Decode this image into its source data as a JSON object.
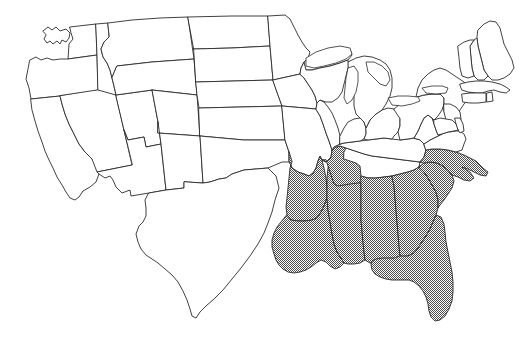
{
  "map": {
    "title": "United States map with highlighted southeastern states",
    "region_label": "Contiguous United States",
    "background_color": "#ffffff",
    "outline_color": "#2b2b2b",
    "highlight_fill_color": "#808080",
    "highlight_pattern": "checkerboard-dither",
    "unhighlighted_fill_color": "#ffffff",
    "highlighted_count": "9",
    "legend_visible": "false",
    "labels_visible": "false",
    "highlighted_states": [
      "Arkansas",
      "Louisiana",
      "Mississippi",
      "Alabama",
      "Georgia",
      "Florida",
      "South Carolina",
      "North Carolina",
      "Tennessee (western)"
    ],
    "states": [
      {
        "id": "WA",
        "name": "Washington",
        "highlighted": false,
        "path": "M43,31 L48,27 L52,30 L56,27 L60,31 L66,29 L70,33 L69,38 L66,42 L62,40 L60,44 L57,41 L53,44 L50,41 L47,43 L44,39 L46,35 Z M70,27 L96,24 L97,55 L68,59 L69,44 L73,39 L71,33 Z"
      },
      {
        "id": "OR",
        "name": "Oregon",
        "highlighted": false,
        "path": "M30,60 L36,57 L41,60 L47,58 L53,60 L60,59 L68,59 L97,55 L98,90 L93,92 L60,96 L31,99 L29,88 L26,79 L28,69 Z"
      },
      {
        "id": "CA",
        "name": "California",
        "highlighted": false,
        "path": "M31,99 L60,96 L62,104 L65,114 L69,124 L74,134 L79,144 L85,152 L92,159 L97,166 L99,174 L96,182 L90,187 L83,191 L79,197 L75,200 L70,198 L66,192 L62,185 L57,177 L53,168 L49,160 L45,151 L42,142 L38,131 L35,121 L32,110 Z"
      },
      {
        "id": "ID",
        "name": "Idaho",
        "highlighted": false,
        "path": "M96,24 L108,23 L109,37 L104,42 L101,49 L103,57 L107,63 L110,70 L112,78 L114,86 L116,95 L98,98 L97,55 Z"
      },
      {
        "id": "NV",
        "name": "Nevada",
        "highlighted": false,
        "path": "M98,90 L116,95 L124,130 L132,165 L97,172 L92,159 L85,152 L79,144 L74,134 L69,124 L65,114 L62,104 L60,96 Z"
      },
      {
        "id": "UT",
        "name": "Utah",
        "highlighted": false,
        "path": "M116,95 L152,90 L158,122 L161,144 L146,147 L144,137 L128,140 L124,130 Z"
      },
      {
        "id": "AZ",
        "name": "Arizona",
        "highlighted": false,
        "path": "M124,130 L128,140 L144,137 L146,147 L161,144 L166,190 L149,193 L131,196 L130,190 L122,193 L116,187 L113,180 L110,176 L105,178 L99,174 L97,172 L132,165 Z"
      },
      {
        "id": "MT",
        "name": "Montana",
        "highlighted": false,
        "path": "M108,23 L132,20 L160,18 L188,17 L194,59 L152,62 L117,66 L112,78 L110,70 L107,63 L103,57 L101,49 L104,42 L109,37 Z"
      },
      {
        "id": "WY",
        "name": "Wyoming",
        "highlighted": false,
        "path": "M117,66 L152,62 L194,59 L197,95 L152,90 L116,95 L114,86 L112,78 Z"
      },
      {
        "id": "CO",
        "name": "Colorado",
        "highlighted": false,
        "path": "M152,90 L197,95 L200,136 L158,133 L158,122 L152,90 Z"
      },
      {
        "id": "NM",
        "name": "New Mexico",
        "highlighted": false,
        "path": "M158,133 L200,136 L203,183 L184,182 L184,188 L166,190 L161,144 L158,122 Z"
      },
      {
        "id": "ND",
        "name": "North Dakota",
        "highlighted": false,
        "path": "M188,17 L232,16 L268,16 L270,46 L232,48 L194,49 Z"
      },
      {
        "id": "SD",
        "name": "South Dakota",
        "highlighted": false,
        "path": "M194,49 L232,48 L270,46 L273,80 L234,81 L196,82 Z"
      },
      {
        "id": "NE",
        "name": "Nebraska",
        "highlighted": false,
        "path": "M196,82 L234,81 L273,80 L278,95 L282,106 L241,107 L199,108 L197,95 Z"
      },
      {
        "id": "KS",
        "name": "Kansas",
        "highlighted": false,
        "path": "M199,108 L241,107 L282,106 L285,140 L244,140 L200,136 Z"
      },
      {
        "id": "OK",
        "name": "Oklahoma",
        "highlighted": false,
        "path": "M200,136 L244,140 L285,140 L289,152 L292,162 L282,162 L268,168 L256,169 L244,170 L232,174 L226,178 L219,179 L210,182 L203,183 L200,136 Z"
      },
      {
        "id": "TX",
        "name": "Texas",
        "highlighted": false,
        "path": "M203,183 L210,182 L219,179 L226,178 L232,174 L244,170 L256,169 L268,168 L276,176 L279,188 L275,200 L272,212 L268,223 L264,233 L258,244 L250,256 L241,268 L232,279 L223,290 L214,299 L206,306 L200,312 L196,318 L192,316 L190,309 L187,300 L183,291 L178,282 L172,275 L165,269 L158,263 L152,259 L146,255 L141,249 L138,242 L136,234 L139,226 L143,222 L146,216 L146,208 L145,200 L148,194 L149,193 L166,190 L184,188 L184,182 Z"
      },
      {
        "id": "MN",
        "name": "Minnesota",
        "highlighted": false,
        "path": "M268,16 L285,15 L290,19 L294,27 L298,35 L302,42 L306,48 L310,52 L308,58 L304,62 L301,68 L300,74 L273,80 L270,46 Z"
      },
      {
        "id": "IA",
        "name": "Iowa",
        "highlighted": false,
        "path": "M273,80 L300,74 L304,78 L308,84 L312,90 L315,96 L317,103 L316,109 L282,106 L278,95 Z"
      },
      {
        "id": "MO",
        "name": "Missouri",
        "highlighted": false,
        "path": "M282,106 L316,109 L320,116 L323,124 L326,133 L329,141 L332,150 L331,157 L326,162 L322,160 L320,156 L318,161 L316,168 L313,173 L309,176 L304,174 L298,172 L292,168 L289,161 L289,152 L285,140 Z"
      },
      {
        "id": "AR",
        "name": "Arkansas",
        "highlighted": true,
        "path": "M289,152 L289,161 L292,168 L298,172 L304,174 L309,176 L313,173 L316,168 L318,161 L320,156 L322,160 L324,168 L326,178 L327,188 L327,198 L324,206 L321,212 L317,218 L312,220 L305,221 L298,221 L291,220 L287,215 L286,207 L287,198 L288,188 L289,178 L290,168 L292,162 Z"
      },
      {
        "id": "LA",
        "name": "Louisiana",
        "highlighted": true,
        "path": "M287,215 L291,220 L298,221 L305,221 L312,220 L317,218 L321,212 L324,206 L327,198 L328,210 L330,222 L332,234 L334,244 L337,252 L341,258 L344,263 L340,267 L335,269 L330,266 L326,262 L321,260 L316,263 L311,267 L306,270 L300,272 L294,273 L288,272 L283,269 L279,265 L276,260 L274,254 L272,247 L272,240 L274,233 L277,227 L281,222 Z"
      },
      {
        "id": "MS",
        "name": "Mississippi",
        "highlighted": true,
        "path": "M327,198 L327,188 L327,178 L328,168 L330,160 L333,156 L338,157 L344,159 L350,161 L356,163 L360,166 L361,176 L361,187 L361,198 L361,209 L361,220 L362,231 L363,242 L364,252 L365,260 L360,263 L354,264 L348,264 L344,263 L341,258 L337,252 L334,244 L332,234 L330,222 L328,210 Z"
      },
      {
        "id": "TN",
        "name": "Tennessee",
        "highlighted": true,
        "path": "M322,160 L326,162 L331,157 L332,150 L336,147 L340,146 L346,148 L352,150 L358,152 L364,154 L372,156 L380,157 L388,158 L396,159 L404,160 L412,161 L418,162 L420,166 L416,170 L410,172 L404,174 L398,176 L390,178 L382,180 L374,181 L366,182 L358,183 L350,184 L344,185 L338,186 L334,184 L332,178 L330,172 L328,166 L326,160 Z",
        "note": "western-portion-shaded"
      },
      {
        "id": "TN-white",
        "name": "Tennessee eastern",
        "highlighted": false,
        "path": "M344,159 L350,161 L356,163 L360,166 L361,176 L368,178 L376,178 L384,177 L392,176 L400,174 L408,172 L414,170 L419,167 L420,162 L412,161 L404,160 L396,159 L388,158 L380,157 L372,156 L364,154 L358,152 L352,150 L346,148 L344,152 Z"
      },
      {
        "id": "KY",
        "name": "Kentucky",
        "highlighted": false,
        "path": "M332,150 L336,147 L340,146 L346,148 L352,150 L358,152 L364,154 L372,156 L380,157 L388,158 L396,159 L404,160 L412,161 L420,162 L424,157 L426,150 L424,144 L420,140 L414,138 L408,139 L400,140 L392,139 L384,138 L376,139 L368,140 L360,141 L352,142 L344,143 L338,145 L334,147 Z"
      },
      {
        "id": "AL",
        "name": "Alabama",
        "highlighted": true,
        "path": "M361,176 L368,178 L376,178 L384,177 L392,176 L394,186 L395,198 L396,210 L397,222 L398,234 L399,246 L400,256 L398,262 L392,264 L386,264 L378,264 L370,263 L365,260 L364,252 L363,242 L362,231 L361,220 L361,209 L361,198 L361,187 Z"
      },
      {
        "id": "GA",
        "name": "Georgia",
        "highlighted": true,
        "path": "M392,176 L400,174 L408,172 L414,170 L419,167 L424,172 L428,178 L432,185 L436,192 L438,200 L438,208 L436,215 L433,222 L430,229 L426,236 L422,242 L418,248 L414,253 L408,256 L402,257 L400,256 L399,246 L398,234 L397,222 L396,210 L395,198 L394,186 Z"
      },
      {
        "id": "FL",
        "name": "Florida",
        "highlighted": true,
        "path": "M400,256 L408,256 L414,253 L418,248 L422,242 L426,236 L430,229 L433,222 L436,215 L441,217 L444,224 L445,232 L446,242 L448,252 L450,262 L452,272 L453,282 L453,292 L452,301 L449,309 L445,316 L440,320 L435,321 L431,317 L429,311 L428,304 L426,297 L423,291 L419,286 L414,282 L409,280 L404,280 L398,280 L392,280 L386,279 L380,277 L375,274 L372,270 L371,265 L372,261 L376,259 L382,258 L388,258 L394,258 Z"
      },
      {
        "id": "SC",
        "name": "South Carolina",
        "highlighted": true,
        "path": "M419,167 L424,163 L430,162 L437,163 L443,166 L448,170 L452,175 L454,181 L452,188 L448,194 L444,200 L440,205 L438,208 L438,200 L436,192 L432,185 L428,178 L424,172 Z"
      },
      {
        "id": "NC",
        "name": "North Carolina",
        "highlighted": true,
        "path": "M420,162 L424,157 L426,150 L432,149 L440,149 L448,150 L456,152 L464,155 L470,158 L476,161 L480,165 L484,169 L488,172 L486,176 L480,175 L474,172 L468,169 L462,167 L470,172 L474,178 L470,181 L464,180 L458,177 L452,175 L448,170 L443,166 L437,163 L430,162 L424,163 Z"
      },
      {
        "id": "VA",
        "name": "Virginia",
        "highlighted": false,
        "path": "M424,144 L430,140 L436,137 L442,134 L448,132 L454,131 L460,131 L464,134 L466,139 L464,144 L462,150 L456,152 L448,150 L440,149 L432,149 L426,150 Z"
      },
      {
        "id": "WV",
        "name": "West Virginia",
        "highlighted": false,
        "path": "M414,138 L418,131 L421,124 L424,118 L428,115 L432,118 L434,124 L436,130 L438,135 L442,134 L436,137 L430,140 L424,144 L420,140 Z"
      },
      {
        "id": "IL",
        "name": "Illinois",
        "highlighted": false,
        "path": "M316,109 L317,103 L320,100 L324,102 L328,107 L332,113 L335,120 L338,128 L340,136 L340,144 L338,145 L334,147 L332,150 L329,141 L326,133 L323,124 L320,116 Z"
      },
      {
        "id": "IN",
        "name": "Indiana",
        "highlighted": false,
        "path": "M340,136 L344,128 L348,122 L354,119 L360,118 L364,122 L366,128 L366,134 L364,139 L360,141 L352,142 L344,143 L340,144 Z"
      },
      {
        "id": "OH",
        "name": "Ohio",
        "highlighted": false,
        "path": "M366,128 L370,120 L376,114 L382,110 L388,108 L394,109 L398,113 L400,119 L400,126 L398,132 L394,136 L392,139 L384,138 L376,139 L368,140 L364,139 L366,134 Z"
      },
      {
        "id": "MI",
        "name": "Michigan",
        "highlighted": false,
        "path": "M348,62 L356,58 L364,56 L372,57 L380,60 L386,64 L390,70 L392,78 L392,88 L390,96 L386,104 L382,110 L376,114 L370,120 L366,128 L364,122 L360,118 L356,114 L354,106 L354,96 L352,86 L350,76 L348,68 Z M304,62 L312,56 L322,51 L332,48 L342,47 L350,49 L352,55 L348,60 L340,63 L330,66 L320,68 L312,70 L306,70 Z"
      },
      {
        "id": "WI",
        "name": "Wisconsin",
        "highlighted": false,
        "path": "M300,74 L301,68 L304,62 L306,70 L312,70 L320,68 L330,66 L340,63 L348,60 L348,68 L346,76 L344,84 L342,92 L338,98 L332,102 L326,102 L320,100 L317,103 L315,96 L312,90 L308,84 L304,78 Z"
      },
      {
        "id": "PA",
        "name": "Pennsylvania",
        "highlighted": false,
        "path": "M394,109 L400,104 L408,100 L416,97 L424,95 L432,94 L440,94 L444,98 L444,104 L442,110 L438,116 L434,120 L432,118 L428,115 L424,118 L421,124 L418,131 L414,138 L408,139 L400,140 L398,132 L400,126 L400,119 Z"
      },
      {
        "id": "NY",
        "name": "New York",
        "highlighted": false,
        "path": "M416,97 L418,88 L422,80 L428,74 L434,70 L440,68 L446,70 L452,74 L458,78 L464,82 L468,87 L470,93 L468,99 L464,104 L460,110 L456,116 L452,120 L448,118 L444,112 L444,104 L444,98 L440,94 L432,94 L424,95 Z"
      },
      {
        "id": "ME",
        "name": "Maine",
        "highlighted": false,
        "path": "M478,30 L484,24 L490,21 L496,22 L500,28 L502,36 L504,44 L508,52 L512,60 L514,68 L510,74 L504,78 L498,80 L492,80 L488,76 L484,70 L482,62 L480,54 L478,46 L477,38 Z"
      },
      {
        "id": "NH",
        "name": "New Hampshire",
        "highlighted": false,
        "path": "M470,46 L474,40 L477,38 L478,46 L480,54 L482,62 L484,70 L488,76 L484,80 L478,80 L474,76 L472,68 L471,58 Z"
      },
      {
        "id": "VT",
        "name": "Vermont",
        "highlighted": false,
        "path": "M458,46 L464,42 L470,40 L474,40 L470,46 L471,58 L472,68 L474,76 L468,78 L462,76 L460,68 L459,58 Z"
      },
      {
        "id": "MA",
        "name": "Massachusetts",
        "highlighted": false,
        "path": "M460,84 L468,82 L476,81 L484,81 L492,82 L500,84 L506,87 L510,90 L506,93 L500,92 L494,90 L488,91 L482,93 L476,93 L468,92 L462,90 Z"
      },
      {
        "id": "CT",
        "name": "Connecticut",
        "highlighted": false,
        "path": "M462,94 L470,93 L478,93 L486,93 L486,102 L478,103 L470,103 L463,102 Z"
      },
      {
        "id": "RI",
        "name": "Rhode Island",
        "highlighted": false,
        "path": "M487,93 L492,92 L493,101 L487,102 Z"
      },
      {
        "id": "NJ",
        "name": "New Jersey",
        "highlighted": false,
        "path": "M444,104 L450,104 L456,107 L460,112 L461,119 L459,126 L455,131 L450,132 L447,127 L446,120 L444,112 Z"
      },
      {
        "id": "DE",
        "name": "Delaware",
        "highlighted": false,
        "path": "M455,118 L460,118 L463,124 L464,131 L460,133 L457,128 Z"
      },
      {
        "id": "MD",
        "name": "Maryland",
        "highlighted": false,
        "path": "M434,120 L440,118 L446,119 L452,120 L456,124 L458,130 L454,131 L448,132 L442,134 L438,135 L436,130 L434,124 Z"
      }
    ],
    "lakes": [
      {
        "id": "lake-superior",
        "name": "Lake Superior",
        "path": "M306,58 L316,52 L328,48 L340,46 L350,48 L352,54 L346,59 L336,63 L324,66 L314,68 L306,66 Z"
      },
      {
        "id": "lake-michigan",
        "name": "Lake Michigan",
        "path": "M348,68 L354,66 L358,72 L358,82 L356,92 L352,100 L347,104 L344,98 L345,88 L346,78 Z"
      },
      {
        "id": "lake-huron",
        "name": "Lake Huron",
        "path": "M366,62 L374,62 L382,66 L388,72 L390,80 L386,86 L380,84 L374,78 L368,72 Z"
      },
      {
        "id": "lake-erie",
        "name": "Lake Erie",
        "path": "M388,98 L398,96 L408,96 L418,97 L420,101 L412,104 L402,106 L392,105 Z"
      },
      {
        "id": "lake-ontario",
        "name": "Lake Ontario",
        "path": "M422,88 L432,86 L442,86 L448,88 L446,93 L436,94 L426,93 Z"
      }
    ]
  }
}
